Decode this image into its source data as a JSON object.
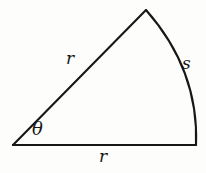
{
  "figure": {
    "kind": "circular-sector-diagram",
    "background_color": "#fdfdfc",
    "stroke_color": "#171717",
    "stroke_width": 2.1,
    "labels": {
      "radius_upper": "r",
      "arc": "s",
      "radius_base": "r",
      "angle": "θ"
    },
    "geometry": {
      "vertex": [
        13,
        145
      ],
      "apex": [
        146,
        10
      ],
      "arc_end": [
        196,
        145
      ],
      "arc_control": [
        200,
        72
      ],
      "arc_path": "M 146 10 Q 199 70 196 145",
      "base_path": "M 13 145 L 196 145",
      "radius_path": "M 13 145 L 146 10"
    }
  }
}
